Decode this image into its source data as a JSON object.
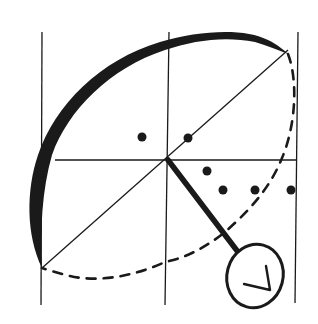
{
  "diagram": {
    "type": "hand-drawn geometric sketch",
    "colors": {
      "background": "#ffffff",
      "ink": "#1a1a1a"
    },
    "grid": {
      "vertical_lines_x": [
        42,
        168,
        297
      ],
      "horizontal_line_y": 160,
      "center": [
        168,
        160
      ]
    },
    "diagonal": {
      "from": [
        42,
        268
      ],
      "to": [
        297,
        47
      ]
    },
    "thick_arc": {
      "style": "solid-heavy"
    },
    "dashed_arc": {
      "style": "dashed"
    },
    "handle": {
      "from": [
        168,
        160
      ],
      "to": [
        237,
        250
      ]
    },
    "dial": {
      "center": [
        255,
        276
      ],
      "rx": 28,
      "ry": 32,
      "symbol": "check-mark"
    },
    "dots": [
      {
        "x": 142,
        "y": 137
      },
      {
        "x": 188,
        "y": 138
      },
      {
        "x": 207,
        "y": 171
      },
      {
        "x": 222,
        "y": 190
      },
      {
        "x": 255,
        "y": 190
      },
      {
        "x": 290,
        "y": 190
      }
    ]
  }
}
